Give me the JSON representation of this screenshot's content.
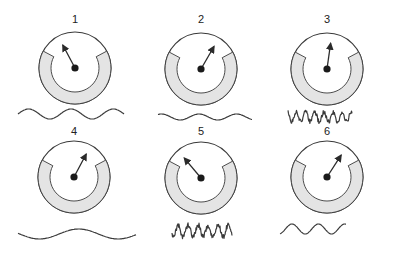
{
  "figure": {
    "colors": {
      "stroke": "#3a3a3a",
      "band_fill": "#e4e4e4",
      "background": "#ffffff"
    },
    "panels": [
      {
        "label": "1",
        "needle_angle_deg": -28,
        "wave": {
          "type": "slow",
          "amplitude": "medium",
          "cycles": 2.5
        }
      },
      {
        "label": "2",
        "needle_angle_deg": 30,
        "wave": {
          "type": "slow",
          "amplitude": "small",
          "cycles": 2.5
        }
      },
      {
        "label": "3",
        "needle_angle_deg": 8,
        "wave": {
          "type": "fast",
          "amplitude": "medium",
          "cycles": 7
        }
      },
      {
        "label": "4",
        "needle_angle_deg": 28,
        "wave": {
          "type": "very-slow",
          "amplitude": "medium",
          "cycles": 1.5
        }
      },
      {
        "label": "5",
        "needle_angle_deg": -40,
        "wave": {
          "type": "fast",
          "amplitude": "large",
          "cycles": 6
        }
      },
      {
        "label": "6",
        "needle_angle_deg": 33,
        "wave": {
          "type": "slow",
          "amplitude": "medium",
          "cycles": 2.5
        }
      }
    ]
  }
}
